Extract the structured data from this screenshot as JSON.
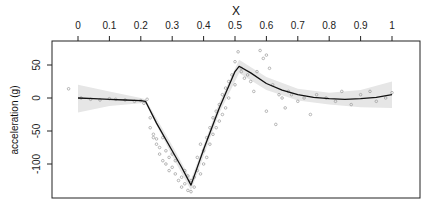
{
  "chart_data": {
    "type": "scatter",
    "title": "",
    "xlabel": "X",
    "ylabel": "acceleration (g)",
    "xlim": [
      -0.08,
      1.09
    ],
    "ylim": [
      -152,
      88
    ],
    "x_axis_position": "top",
    "x_ticks": [
      0,
      0.1,
      0.2,
      0.3,
      0.4,
      0.5,
      0.6,
      0.7,
      0.8,
      0.9,
      1
    ],
    "x_tick_labels": [
      "0",
      "0.1",
      "0.2",
      "0.3",
      "0.4",
      "0.5",
      "0.6",
      "0.7",
      "0.8",
      "0.9",
      "1"
    ],
    "y_ticks": [
      50,
      0,
      -50,
      -100
    ],
    "y_tick_labels": [
      "50",
      "0",
      "-50",
      "-100"
    ],
    "grid": false,
    "legend": null,
    "series": [
      {
        "name": "fitted curve",
        "kind": "line",
        "x": [
          0.0,
          0.05,
          0.1,
          0.15,
          0.2,
          0.215,
          0.25,
          0.3,
          0.33,
          0.36,
          0.4,
          0.45,
          0.5,
          0.513,
          0.55,
          0.6,
          0.65,
          0.7,
          0.75,
          0.8,
          0.85,
          0.9,
          0.95,
          1.0
        ],
        "y": [
          0,
          -1,
          -2,
          -3,
          -4,
          -5,
          -38,
          -80,
          -105,
          -132,
          -78,
          -15,
          40,
          48,
          38,
          22,
          12,
          5,
          1,
          -1,
          -2,
          -1,
          1,
          5
        ]
      },
      {
        "name": "confidence band",
        "kind": "area",
        "x": [
          0.0,
          0.1,
          0.2,
          0.215,
          0.3,
          0.36,
          0.45,
          0.513,
          0.6,
          0.7,
          0.8,
          0.9,
          1.0
        ],
        "lower": [
          -22,
          -12,
          -8,
          -8,
          -88,
          -140,
          -23,
          38,
          12,
          -4,
          -10,
          -14,
          -15
        ],
        "upper": [
          20,
          10,
          0,
          -2,
          -72,
          -124,
          -7,
          58,
          32,
          14,
          8,
          12,
          25
        ]
      },
      {
        "name": "observations",
        "kind": "points",
        "x": [
          -0.03,
          0.01,
          0.04,
          0.07,
          0.1,
          0.12,
          0.15,
          0.18,
          0.2,
          0.21,
          0.22,
          0.23,
          0.23,
          0.24,
          0.24,
          0.25,
          0.25,
          0.26,
          0.26,
          0.27,
          0.27,
          0.28,
          0.28,
          0.29,
          0.29,
          0.3,
          0.3,
          0.31,
          0.31,
          0.32,
          0.33,
          0.33,
          0.34,
          0.34,
          0.35,
          0.35,
          0.36,
          0.36,
          0.37,
          0.37,
          0.38,
          0.38,
          0.39,
          0.39,
          0.4,
          0.4,
          0.41,
          0.41,
          0.42,
          0.42,
          0.43,
          0.43,
          0.44,
          0.44,
          0.45,
          0.45,
          0.46,
          0.46,
          0.47,
          0.47,
          0.48,
          0.48,
          0.49,
          0.5,
          0.5,
          0.51,
          0.52,
          0.52,
          0.53,
          0.54,
          0.55,
          0.56,
          0.57,
          0.58,
          0.59,
          0.6,
          0.6,
          0.61,
          0.62,
          0.63,
          0.64,
          0.65,
          0.66,
          0.67,
          0.68,
          0.7,
          0.72,
          0.74,
          0.76,
          0.79,
          0.82,
          0.84,
          0.87,
          0.9,
          0.93,
          0.95,
          0.98,
          1.0
        ],
        "y": [
          14,
          0,
          -2,
          -3,
          -1,
          -2,
          -3,
          -5,
          -4,
          -8,
          -2,
          -30,
          -45,
          -55,
          -60,
          -70,
          -62,
          -85,
          -75,
          -95,
          -60,
          -100,
          -80,
          -110,
          -90,
          -105,
          -85,
          -115,
          -95,
          -125,
          -120,
          -135,
          -110,
          -130,
          -140,
          -118,
          -142,
          -125,
          -135,
          -120,
          -110,
          -90,
          -115,
          -70,
          -100,
          -80,
          -60,
          -90,
          -45,
          -70,
          -30,
          -55,
          -20,
          -45,
          -10,
          -35,
          5,
          -25,
          15,
          -15,
          25,
          0,
          35,
          55,
          20,
          70,
          45,
          40,
          30,
          35,
          25,
          10,
          40,
          72,
          60,
          65,
          -20,
          45,
          20,
          -40,
          5,
          0,
          -15,
          10,
          5,
          -5,
          0,
          -25,
          5,
          0,
          -5,
          10,
          -10,
          5,
          10,
          -5,
          0,
          8
        ]
      }
    ]
  }
}
